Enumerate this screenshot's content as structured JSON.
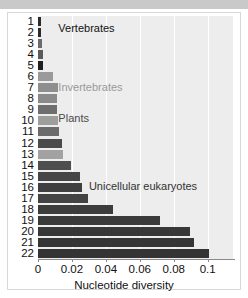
{
  "figure": {
    "background_color": "#ffffff",
    "plot_background_color": "#ededed",
    "top_band_color": "#c9c9c9"
  },
  "chart_data": {
    "type": "bar",
    "orientation": "horizontal",
    "title": "",
    "xlabel": "Nucleotide diversity",
    "ylabel": "",
    "xlim": [
      0,
      0.1155
    ],
    "ylim": [
      0.5,
      22.5
    ],
    "grid": true,
    "grid_axis": "x",
    "legend": null,
    "xticks": [
      0,
      0.02,
      0.04,
      0.06,
      0.08,
      0.1
    ],
    "xticklabels": [
      "0",
      "0.02",
      "0.04",
      "0.06",
      "0.08",
      "0.1"
    ],
    "categories": [
      "1",
      "2",
      "3",
      "4",
      "5",
      "6",
      "7",
      "8",
      "9",
      "10",
      "11",
      "12",
      "13",
      "14",
      "15",
      "16",
      "17",
      "18",
      "19",
      "20",
      "21",
      "22"
    ],
    "values": [
      0.0018,
      0.0019,
      0.0026,
      0.0028,
      0.0031,
      0.0086,
      0.0115,
      0.0112,
      0.0111,
      0.0118,
      0.0124,
      0.0142,
      0.0146,
      0.0196,
      0.0249,
      0.0262,
      0.0293,
      0.044,
      0.0718,
      0.0898,
      0.092,
      0.101
    ],
    "bar_colors": [
      "#2b2b2b",
      "#2b2b2b",
      "#6b6b6b",
      "#5a5a5a",
      "#1f1f1f",
      "#9a9a9a",
      "#8e8e8e",
      "#8a8a8a",
      "#6e6e6e",
      "#9e9e9e",
      "#6b6b6b",
      "#4a4a4a",
      "#a2a2a2",
      "#4e4e4e",
      "#464646",
      "#3f3f3f",
      "#434343",
      "#3c3c3c",
      "#3a3a3a",
      "#383838",
      "#363636",
      "#343434"
    ],
    "annotations": [
      {
        "text": "Vertebrates",
        "x": 0.012,
        "y": 1.6,
        "color": "#111111"
      },
      {
        "text": "Invertebrates",
        "x": 0.012,
        "y": 7.0,
        "color": "#9a9a9a"
      },
      {
        "text": "Plants",
        "x": 0.012,
        "y": 9.8,
        "color": "#4a4a4a"
      },
      {
        "text": "Unicellular eukaryotes",
        "x": 0.03,
        "y": 15.9,
        "color": "#333333"
      }
    ]
  }
}
